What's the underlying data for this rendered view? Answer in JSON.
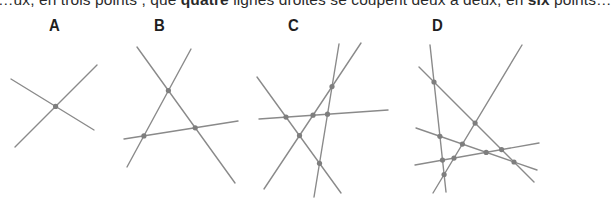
{
  "caption": {
    "before_1": "…ux, en trois points ; que ",
    "bold_1": "quatre",
    "middle": " lignes droites se coupent deux à deux, en ",
    "bold_2": "six",
    "after": " points…"
  },
  "figures": [
    {
      "label": "A",
      "line_count": 2,
      "intersection_count": 1
    },
    {
      "label": "B",
      "line_count": 3,
      "intersection_count": 3
    },
    {
      "label": "C",
      "line_count": 4,
      "intersection_count": 6
    },
    {
      "label": "D",
      "line_count": 5,
      "intersection_count": 10
    }
  ],
  "colors": {
    "line": "#8a8a8a",
    "point": "#7e7e7e",
    "label": "#1f1f1f"
  }
}
